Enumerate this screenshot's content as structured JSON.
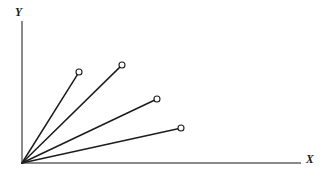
{
  "figure": {
    "title": "",
    "width": 325,
    "height": 177,
    "background_color": "#ffffff"
  },
  "axes": {
    "x": {
      "label": "X",
      "label_style": "italic",
      "color": "#8a8a8a",
      "start": [
        22,
        163
      ],
      "end": [
        300,
        163
      ]
    },
    "y": {
      "label": "Y",
      "label_style": "italic",
      "color": "#8a8a8a",
      "start": [
        22,
        163
      ],
      "end": [
        22,
        22
      ]
    },
    "origin": [
      22,
      163
    ]
  },
  "chart_data": {
    "type": "scatter",
    "title": "",
    "xlabel": "X",
    "ylabel": "Y",
    "grid": false,
    "legend": false,
    "axis_arrows": false,
    "origin": [
      0,
      0
    ],
    "xlim": [
      0,
      278
    ],
    "ylim": [
      0,
      141
    ],
    "marker": "open-circle",
    "marker_radius": 3,
    "line_color": "#1c1c1c",
    "series": [
      {
        "name": "ray-1",
        "angle_deg": 57.8,
        "length": 107.6,
        "x": [
          0,
          57
        ],
        "y": [
          0,
          91
        ],
        "endpoint_px": [
          79,
          72
        ]
      },
      {
        "name": "ray-2",
        "angle_deg": 44.5,
        "length": 140.3,
        "x": [
          0,
          100
        ],
        "y": [
          0,
          98
        ],
        "endpoint_px": [
          122,
          65
        ]
      },
      {
        "name": "ray-3",
        "angle_deg": 26.5,
        "length": 143.1,
        "x": [
          0,
          135
        ],
        "y": [
          0,
          64
        ],
        "endpoint_px": [
          157,
          99
        ]
      },
      {
        "name": "ray-4",
        "angle_deg": 13.0,
        "length": 163.2,
        "x": [
          0,
          159
        ],
        "y": [
          0,
          35
        ],
        "endpoint_px": [
          181,
          128
        ]
      }
    ]
  }
}
